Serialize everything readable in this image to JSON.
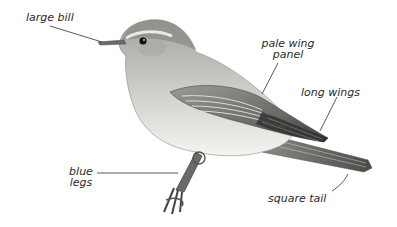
{
  "diagram": {
    "labels": [
      {
        "id": "large-bill",
        "text": "large bill"
      },
      {
        "id": "pale-wing-panel",
        "line1": "pale wing",
        "line2": "panel"
      },
      {
        "id": "long-wings",
        "text": "long wings"
      },
      {
        "id": "blue-legs",
        "line1": "blue",
        "line2": "legs"
      },
      {
        "id": "square-tail",
        "text": "square tail"
      }
    ],
    "colors": {
      "background": "#ffffff",
      "text": "#2a2a2a",
      "leader_line": "#444444",
      "head": "#9a9a96",
      "underparts": "#f2f2ee",
      "wing": "#7d7d79",
      "wing_dark": "#3f3f3d",
      "tail": "#5d5d5a",
      "legs": "#555555"
    }
  }
}
